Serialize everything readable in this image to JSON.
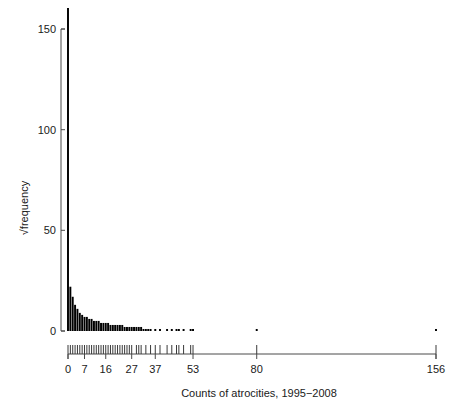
{
  "chart_data": {
    "type": "bar",
    "title": "",
    "subtitle": "",
    "xlabel": "Counts of atrocities, 1995−2008",
    "ylabel": "√frequency",
    "xlim": [
      0,
      156
    ],
    "ylim": [
      0,
      162
    ],
    "grid": false,
    "legend": "none",
    "y_ticks": [
      0,
      50,
      100,
      150
    ],
    "y_tick_labels": [
      "0",
      "50",
      "100",
      "150"
    ],
    "x_ticks": [
      0,
      7,
      16,
      27,
      37,
      53,
      80,
      156
    ],
    "x_tick_labels": [
      "0",
      "7",
      "16",
      "27",
      "37",
      "53",
      "80",
      "156"
    ],
    "note": "Histogram of counts of atrocities with square-root frequency on the vertical axis; lower axis is a rug of distinct observed count values.",
    "categories": [
      0,
      1,
      2,
      3,
      4,
      5,
      6,
      7,
      8,
      9,
      10,
      11,
      12,
      13,
      14,
      15,
      16,
      17,
      18,
      19,
      20,
      21,
      22,
      23,
      24,
      25,
      26,
      27,
      28,
      29,
      30,
      31,
      32,
      33,
      34,
      35,
      36,
      37,
      38,
      39,
      40,
      41,
      42,
      43,
      44,
      45,
      46,
      47,
      48,
      49,
      50,
      51,
      52,
      53,
      54,
      55,
      56,
      57,
      58,
      59,
      60,
      61,
      62,
      63,
      64,
      65,
      66,
      67,
      68,
      69,
      70,
      71,
      72,
      73,
      74,
      75,
      76,
      77,
      78,
      79,
      80,
      81,
      156
    ],
    "values": [
      162,
      22,
      17,
      13,
      11,
      9,
      8,
      7,
      7,
      6,
      6,
      5,
      5,
      5,
      4,
      4,
      4,
      4,
      3,
      3,
      3,
      3,
      3,
      3,
      2,
      2,
      2,
      2,
      2,
      2,
      2,
      2,
      1,
      1,
      1,
      1,
      0,
      1,
      0,
      1,
      0,
      0,
      1,
      0,
      1,
      0,
      1,
      1,
      0,
      1,
      0,
      0,
      1,
      1,
      0,
      0,
      0,
      0,
      0,
      0,
      0,
      0,
      0,
      0,
      0,
      0,
      0,
      0,
      0,
      0,
      0,
      0,
      0,
      0,
      0,
      0,
      0,
      0,
      0,
      0,
      1,
      0,
      1
    ],
    "rug_values": [
      0,
      1,
      2,
      3,
      4,
      5,
      6,
      7,
      8,
      9,
      10,
      11,
      12,
      13,
      14,
      15,
      16,
      17,
      18,
      19,
      20,
      21,
      22,
      23,
      24,
      25,
      26,
      27,
      29,
      30,
      31,
      33,
      35,
      37,
      39,
      42,
      44,
      46,
      47,
      49,
      52,
      53,
      80,
      156
    ]
  },
  "axes": {
    "y_label": "√frequency",
    "x_label": "Counts of atrocities, 1995−2008"
  }
}
